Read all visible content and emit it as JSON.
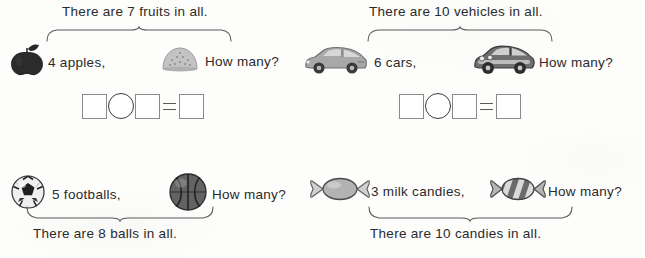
{
  "page": {
    "type": "math-worksheet",
    "background_color": "#fdfdfc",
    "text_color": "#2a2a2a"
  },
  "problems": [
    {
      "id": "fruits",
      "total_caption": "There are 7 fruits in all.",
      "caption_position": "top",
      "brace_direction": "up",
      "known": {
        "icon": "apple-icon",
        "label": "4 apples,",
        "count": 4,
        "color": "#2b2b2b"
      },
      "unknown": {
        "icon": "bun-icon",
        "label": "How many?",
        "color": "#b4b4b4"
      },
      "equation": {
        "box1": "",
        "operator": "",
        "box2": "",
        "equals": "=",
        "box3": ""
      }
    },
    {
      "id": "vehicles",
      "total_caption": "There are 10 vehicles in all.",
      "caption_position": "top",
      "brace_direction": "up",
      "known": {
        "icon": "hatchback-car-icon",
        "label": "6 cars,",
        "count": 6,
        "color": "#9a9a9a"
      },
      "unknown": {
        "icon": "classic-car-icon",
        "label": "How many?",
        "color": "#6e6e6e"
      },
      "equation": {
        "box1": "",
        "operator": "",
        "box2": "",
        "equals": "=",
        "box3": ""
      }
    },
    {
      "id": "balls",
      "total_caption": "There are 8 balls in all.",
      "caption_position": "bottom",
      "brace_direction": "down",
      "known": {
        "icon": "soccer-ball-icon",
        "label": "5 footballs,",
        "count": 5,
        "color": "#e8e8e8"
      },
      "unknown": {
        "icon": "basketball-icon",
        "label": "How many?",
        "color": "#5f5f5f"
      }
    },
    {
      "id": "candies",
      "total_caption": "There are 10 candies in all.",
      "caption_position": "bottom",
      "brace_direction": "down",
      "known": {
        "icon": "candy-plain-icon",
        "label": "3 milk candies,",
        "count": 3,
        "color": "#a9a9a9"
      },
      "unknown": {
        "icon": "candy-striped-icon",
        "label": "How many?",
        "color": "#8a8a8a"
      }
    }
  ]
}
